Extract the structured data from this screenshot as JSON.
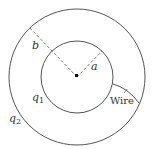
{
  "diagram": {
    "type": "concentric-spherical-shells",
    "labels": {
      "inner_radius": "a",
      "outer_radius": "b",
      "inner_charge": "q",
      "inner_charge_sub": "1",
      "outer_charge": "q",
      "outer_charge_sub": "2",
      "wire": "Wire"
    },
    "colors": {
      "stroke": "#555555",
      "text": "#333333",
      "center_dot": "#111111"
    }
  }
}
